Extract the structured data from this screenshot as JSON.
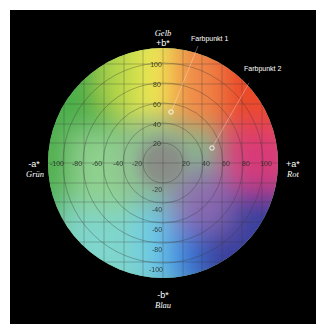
{
  "diagram": {
    "axes": {
      "top": {
        "symbol": "+b*",
        "name": "Gelb"
      },
      "bottom": {
        "symbol": "-b*",
        "name": "Blau"
      },
      "left": {
        "symbol": "-a*",
        "name": "Grün"
      },
      "right": {
        "symbol": "+a*",
        "name": "Rot"
      }
    },
    "ticks_horizontal": [
      "-100",
      "-80",
      "-60",
      "-40",
      "-20",
      "20",
      "40",
      "60",
      "80",
      "100"
    ],
    "ticks_vertical": [
      "100",
      "80",
      "60",
      "40",
      "20",
      "-20",
      "-40",
      "-60",
      "-80",
      "-100"
    ],
    "points": [
      {
        "label": "Farbpunkt 1",
        "a": 7,
        "b": 51
      },
      {
        "label": "Farbpunkt 2",
        "a": 48,
        "b": 15
      }
    ],
    "colors": {
      "background": "#000000",
      "yellow": "#f5e84a",
      "red": "#e8442a",
      "magenta": "#d9407a",
      "blue": "#2a3c9a",
      "cyan": "#6fd0e0",
      "green": "#4caf48",
      "gray_center": "#8a8a86"
    }
  }
}
